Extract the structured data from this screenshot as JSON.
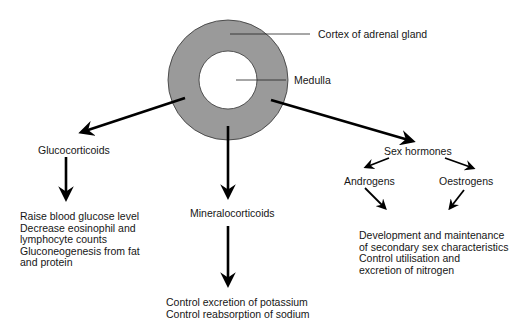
{
  "gland": {
    "cortex_label": "Cortex of adrenal gland",
    "medulla_label": "Medulla",
    "cortex_color": "#9a9a9a",
    "medulla_color": "#ffffff"
  },
  "branches": {
    "glucocorticoids": {
      "title": "Glucocorticoids",
      "effects": [
        "Raise blood glucose level",
        "Decrease eosinophil and",
        "lymphocyte counts",
        "Gluconeogenesis from fat",
        "and protein"
      ]
    },
    "mineralocorticoids": {
      "title": "Mineralocorticoids",
      "effects": [
        "Control excretion of potassium",
        "Control reabsorption of sodium"
      ]
    },
    "sex_hormones": {
      "title": "Sex hormones",
      "sub": [
        "Androgens",
        "Oestrogens"
      ],
      "effects": [
        "Development and maintenance",
        "of secondary sex characteristics",
        "Control utilisation and",
        "excretion of nitrogen"
      ]
    }
  }
}
